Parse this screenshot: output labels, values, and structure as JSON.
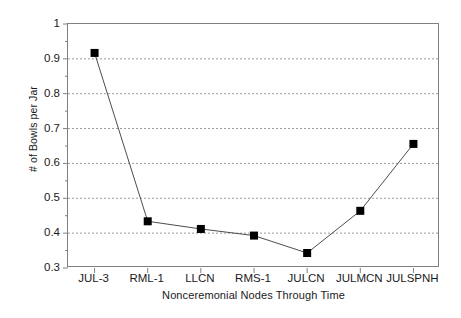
{
  "chart_data": {
    "type": "line",
    "title": "",
    "xlabel": "Nonceremonial Nodes Through Time",
    "ylabel": "# of Bowls per Jar",
    "categories": [
      "JUL-3",
      "RML-1",
      "LLCN",
      "RMS-1",
      "JULCN",
      "JULMCN",
      "JULSPNH"
    ],
    "values": [
      0.917,
      0.434,
      0.412,
      0.393,
      0.343,
      0.464,
      0.656
    ],
    "series": [
      {
        "name": "# of Bowls per Jar",
        "values": [
          0.917,
          0.434,
          0.412,
          0.393,
          0.343,
          0.464,
          0.656
        ]
      }
    ],
    "ylim": [
      0.3,
      1.0
    ],
    "ytick_labels": [
      "0.3",
      "0.4",
      "0.5",
      "0.6",
      "0.7",
      "0.8",
      "0.9",
      "1"
    ],
    "ytick_values": [
      0.3,
      0.4,
      0.5,
      0.6,
      0.7,
      0.8,
      0.9,
      1.0
    ],
    "yminor_step": 0.05,
    "grid": "horizontal-dotted",
    "legend": "none",
    "marker": "filled-square",
    "marker_color": "#000000",
    "line_color": "#4d4d4d",
    "grid_color": "#999999",
    "axis_color": "#808080",
    "background": "#ffffff"
  }
}
